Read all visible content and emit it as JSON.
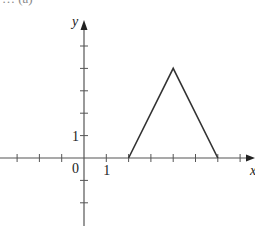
{
  "header_fragment": "… (a)",
  "chart_data": {
    "type": "line",
    "title": "",
    "xlabel": "x",
    "ylabel": "y",
    "x": [
      2,
      4,
      6
    ],
    "series": [
      {
        "name": "f",
        "values": [
          0,
          4,
          0
        ]
      }
    ],
    "x_ticks": [
      -3,
      -2,
      -1,
      0,
      1,
      2,
      3,
      4,
      5,
      6,
      7
    ],
    "y_ticks": [
      -2,
      -1,
      1,
      2,
      3,
      4,
      5
    ],
    "tick_labels": {
      "origin": "0",
      "x_one": "1",
      "y_one": "1"
    },
    "xlim": [
      -3.8,
      7.6
    ],
    "ylim": [
      -3,
      6.5
    ],
    "grid": false,
    "line_color": "#333333",
    "axis_color": "#555555"
  }
}
